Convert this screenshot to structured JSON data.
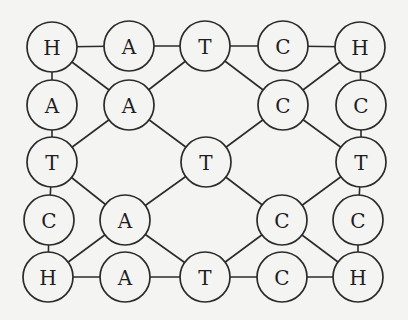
{
  "diagram": {
    "title": "",
    "background": "#f4f4f2",
    "stroke_color": "#2b2b2b",
    "node_radius": 25,
    "nodes": [
      {
        "id": "r1c1",
        "label": "H",
        "x": 52,
        "y": 47
      },
      {
        "id": "r1c2",
        "label": "A",
        "x": 129,
        "y": 46
      },
      {
        "id": "r1c3",
        "label": "T",
        "x": 205,
        "y": 46
      },
      {
        "id": "r1c4",
        "label": "C",
        "x": 283,
        "y": 46
      },
      {
        "id": "r1c5",
        "label": "H",
        "x": 360,
        "y": 47
      },
      {
        "id": "r2c1",
        "label": "A",
        "x": 52,
        "y": 105
      },
      {
        "id": "r2c2",
        "label": "A",
        "x": 129,
        "y": 105
      },
      {
        "id": "r2c4",
        "label": "C",
        "x": 283,
        "y": 105
      },
      {
        "id": "r2c5",
        "label": "C",
        "x": 361,
        "y": 105
      },
      {
        "id": "r3c1",
        "label": "T",
        "x": 52,
        "y": 162
      },
      {
        "id": "r3c3",
        "label": "T",
        "x": 206,
        "y": 162
      },
      {
        "id": "r3c5",
        "label": "T",
        "x": 361,
        "y": 162
      },
      {
        "id": "r4c1",
        "label": "C",
        "x": 49,
        "y": 220
      },
      {
        "id": "r4c2",
        "label": "A",
        "x": 125,
        "y": 220
      },
      {
        "id": "r4c4",
        "label": "C",
        "x": 282,
        "y": 220
      },
      {
        "id": "r4c5",
        "label": "C",
        "x": 358,
        "y": 220
      },
      {
        "id": "r5c1",
        "label": "H",
        "x": 48,
        "y": 277
      },
      {
        "id": "r5c2",
        "label": "A",
        "x": 125,
        "y": 277
      },
      {
        "id": "r5c3",
        "label": "T",
        "x": 205,
        "y": 277
      },
      {
        "id": "r5c4",
        "label": "C",
        "x": 282,
        "y": 277
      },
      {
        "id": "r5c5",
        "label": "H",
        "x": 358,
        "y": 277
      }
    ],
    "edges": [
      [
        "r1c1",
        "r1c2"
      ],
      [
        "r1c2",
        "r1c3"
      ],
      [
        "r1c3",
        "r1c4"
      ],
      [
        "r1c4",
        "r1c5"
      ],
      [
        "r5c1",
        "r5c2"
      ],
      [
        "r5c2",
        "r5c3"
      ],
      [
        "r5c3",
        "r5c4"
      ],
      [
        "r5c4",
        "r5c5"
      ],
      [
        "r1c1",
        "r2c1"
      ],
      [
        "r2c1",
        "r3c1"
      ],
      [
        "r3c1",
        "r4c1"
      ],
      [
        "r4c1",
        "r5c1"
      ],
      [
        "r1c5",
        "r2c5"
      ],
      [
        "r2c5",
        "r3c5"
      ],
      [
        "r3c5",
        "r4c5"
      ],
      [
        "r4c5",
        "r5c5"
      ],
      [
        "r1c1",
        "r2c2"
      ],
      [
        "r2c2",
        "r1c3"
      ],
      [
        "r2c2",
        "r3c1"
      ],
      [
        "r2c2",
        "r3c3"
      ],
      [
        "r1c3",
        "r2c4"
      ],
      [
        "r1c5",
        "r2c4"
      ],
      [
        "r2c4",
        "r3c3"
      ],
      [
        "r2c4",
        "r3c5"
      ],
      [
        "r3c1",
        "r4c2"
      ],
      [
        "r3c3",
        "r4c2"
      ],
      [
        "r4c2",
        "r5c1"
      ],
      [
        "r4c2",
        "r5c3"
      ],
      [
        "r3c3",
        "r4c4"
      ],
      [
        "r3c5",
        "r4c4"
      ],
      [
        "r4c4",
        "r5c3"
      ],
      [
        "r4c4",
        "r5c5"
      ]
    ]
  }
}
